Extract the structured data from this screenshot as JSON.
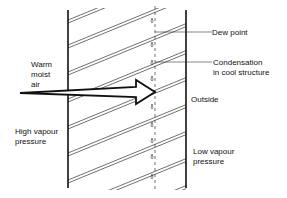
{
  "labels": {
    "warm_moist_air": "Warm\nmoist\nair",
    "high_vapour_pressure": "High vapour\npressure",
    "dew_point": "Dew point",
    "condensation": "Condensation\nin cool structure",
    "outside": "Outside",
    "low_vapour_pressure": "Low vapour\npressure"
  },
  "colors": {
    "ink": "#111111",
    "background": "#ffffff"
  }
}
